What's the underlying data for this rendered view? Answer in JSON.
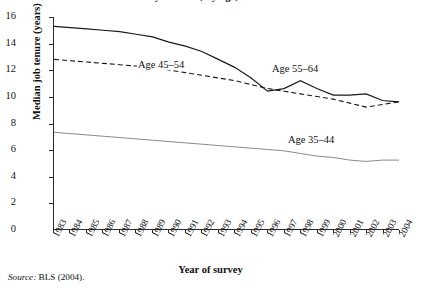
{
  "figure": {
    "title": "salary workers, by age, 1983–2004",
    "source_prefix": "Source:",
    "source_text": " BLS (2004)."
  },
  "annotations": {
    "age_45_54": "Age 45–54",
    "age_55_64": "Age 55–64",
    "age_35_44": "Age 35–44"
  },
  "colors": {
    "axis": "#2a2a2a",
    "series_55_64": "#1a1a1a",
    "series_45_54": "#1a1a1a",
    "series_35_44": "#8a8a8a",
    "background": "#ffffff"
  },
  "chart_data": {
    "type": "line",
    "title": "salary workers, by age, 1983–2004",
    "xlabel": "Year of survey",
    "ylabel": "Median job tenure (years)",
    "xlim": [
      1983,
      2004
    ],
    "ylim": [
      0,
      16
    ],
    "yticks": [
      0,
      2,
      4,
      6,
      8,
      10,
      12,
      14,
      16
    ],
    "grid": false,
    "legend": "in-plot annotations",
    "categories": [
      "1983",
      "1984",
      "1985",
      "1986",
      "1987",
      "1988",
      "1989",
      "1990",
      "1991",
      "1992",
      "1993",
      "1994",
      "1995",
      "1996",
      "1997",
      "1998",
      "1999",
      "2000",
      "2001",
      "2002",
      "2003",
      "2004"
    ],
    "series": [
      {
        "name": "Age 55–64",
        "style": "solid",
        "values": [
          15.3,
          15.2,
          15.1,
          15.0,
          14.9,
          14.7,
          14.5,
          14.1,
          13.8,
          13.4,
          12.8,
          12.2,
          11.4,
          10.4,
          10.6,
          11.2,
          10.6,
          10.1,
          10.1,
          10.2,
          9.7,
          9.6
        ]
      },
      {
        "name": "Age 45–54",
        "style": "dashed",
        "values": [
          12.8,
          12.7,
          12.6,
          12.5,
          12.4,
          12.3,
          12.2,
          12.0,
          11.8,
          11.6,
          11.4,
          11.2,
          10.9,
          10.6,
          10.4,
          10.2,
          10.0,
          9.8,
          9.5,
          9.2,
          9.4,
          9.6
        ]
      },
      {
        "name": "Age 35–44",
        "style": "solid-light",
        "values": [
          7.3,
          7.2,
          7.1,
          7.0,
          6.9,
          6.8,
          6.7,
          6.6,
          6.5,
          6.4,
          6.3,
          6.2,
          6.1,
          6.0,
          5.9,
          5.7,
          5.5,
          5.4,
          5.2,
          5.1,
          5.2,
          5.2
        ]
      }
    ]
  }
}
